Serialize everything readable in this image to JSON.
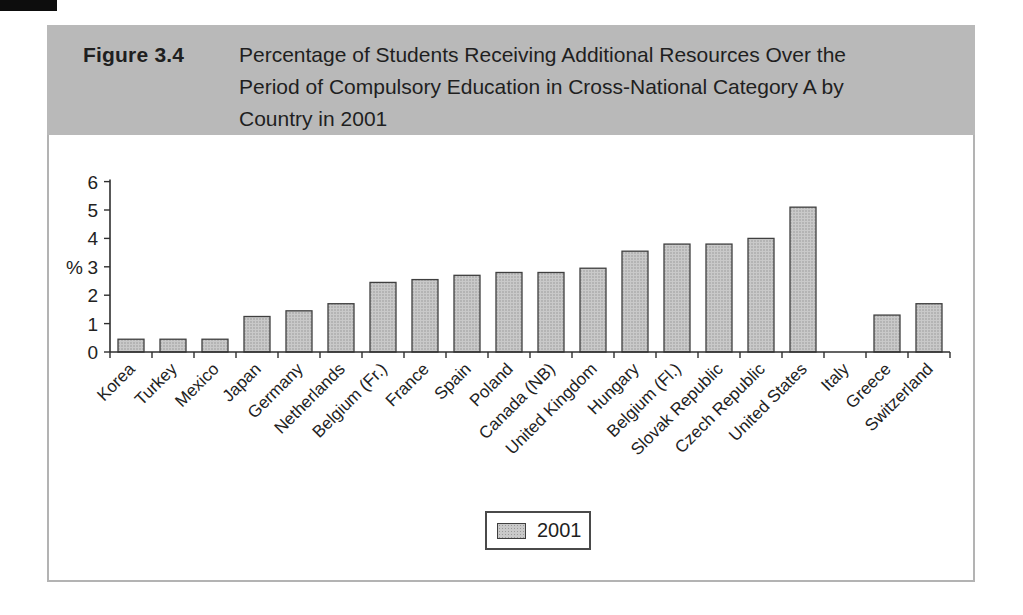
{
  "header": {
    "figure_label": "Figure 3.4",
    "title_lines": [
      "Percentage of Students Receiving Additional Resources Over the",
      "Period of Compulsory Education in Cross-National Category A by",
      "Country in 2001"
    ]
  },
  "chart_data": {
    "type": "bar",
    "title": "Percentage of Students Receiving Additional Resources Over the Period of Compulsory Education in Cross-National Category A by Country in 2001",
    "categories": [
      "Korea",
      "Turkey",
      "Mexico",
      "Japan",
      "Germany",
      "Netherlands",
      "Belgium (Fr.)",
      "France",
      "Spain",
      "Poland",
      "Canada (NB)",
      "United Kingdom",
      "Hungary",
      "Belgium (Fl.)",
      "Slovak Republic",
      "Czech Republic",
      "United States",
      "Italy",
      "Greece",
      "Switzerland"
    ],
    "series": [
      {
        "name": "2001",
        "values": [
          0.45,
          0.45,
          0.45,
          1.25,
          1.45,
          1.7,
          2.45,
          2.55,
          2.7,
          2.8,
          2.8,
          2.95,
          3.55,
          3.8,
          3.8,
          4.0,
          5.1,
          0,
          1.3,
          1.7
        ]
      }
    ],
    "xlabel": "",
    "ylabel": "%",
    "ylim": [
      0,
      6
    ],
    "yticks": [
      0,
      1,
      2,
      3,
      4,
      5,
      6
    ],
    "grid": false,
    "legend": {
      "label": "2001",
      "position": "bottom-center"
    },
    "colors": {
      "bar_fill": "#c9c9c9",
      "bar_dot": "#999999",
      "bar_border": "#3f3f3f",
      "axis": "#2f2f2f",
      "text": "#222222",
      "header_bg": "#b9b9b9"
    }
  }
}
